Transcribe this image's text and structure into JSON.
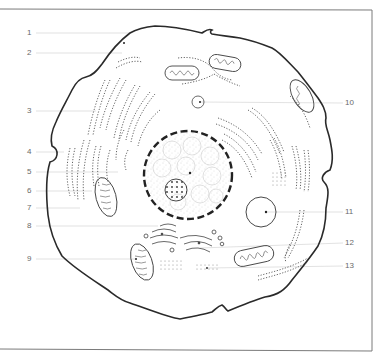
{
  "figure": {
    "title": "",
    "colors": {
      "background": "#ffffff",
      "frame": "#7a7a7a",
      "outline": "#2a2a2a",
      "leader": "#c8c8c8",
      "label": "#6a6a6a"
    }
  },
  "labels": {
    "left": [
      {
        "id": "1",
        "text": "1",
        "y": 33
      },
      {
        "id": "2",
        "text": "2",
        "y": 53
      },
      {
        "id": "3",
        "text": "3",
        "y": 111
      },
      {
        "id": "4",
        "text": "4",
        "y": 152
      },
      {
        "id": "5",
        "text": "5",
        "y": 172
      },
      {
        "id": "6",
        "text": "6",
        "y": 191
      },
      {
        "id": "7",
        "text": "7",
        "y": 208
      },
      {
        "id": "8",
        "text": "8",
        "y": 226
      },
      {
        "id": "9",
        "text": "9",
        "y": 259
      }
    ],
    "right": [
      {
        "id": "10",
        "text": "10",
        "y": 103
      },
      {
        "id": "11",
        "text": "11",
        "y": 212
      },
      {
        "id": "12",
        "text": "12",
        "y": 243
      },
      {
        "id": "13",
        "text": "13",
        "y": 266
      }
    ]
  }
}
